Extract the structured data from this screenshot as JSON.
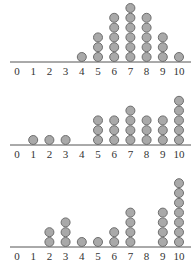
{
  "chart_data": [
    {
      "type": "dot",
      "title": "",
      "xlabel": "",
      "ylabel": "",
      "xlim": [
        0,
        10
      ],
      "tick_labels": [
        "0",
        "1",
        "2",
        "3",
        "4",
        "5",
        "6",
        "7",
        "8",
        "9",
        "10"
      ],
      "categories": [
        0,
        1,
        2,
        3,
        4,
        5,
        6,
        7,
        8,
        9,
        10
      ],
      "values": [
        0,
        0,
        0,
        0,
        1,
        3,
        5,
        6,
        5,
        3,
        1
      ]
    },
    {
      "type": "dot",
      "title": "",
      "xlabel": "",
      "ylabel": "",
      "xlim": [
        0,
        10
      ],
      "tick_labels": [
        "0",
        "1",
        "2",
        "3",
        "4",
        "5",
        "6",
        "7",
        "8",
        "9",
        "10"
      ],
      "categories": [
        0,
        1,
        2,
        3,
        4,
        5,
        6,
        7,
        8,
        9,
        10
      ],
      "values": [
        0,
        1,
        1,
        1,
        0,
        3,
        3,
        4,
        3,
        3,
        5
      ]
    },
    {
      "type": "dot",
      "title": "",
      "xlabel": "",
      "ylabel": "",
      "xlim": [
        0,
        10
      ],
      "tick_labels": [
        "0",
        "1",
        "2",
        "3",
        "4",
        "5",
        "6",
        "7",
        "8",
        "9",
        "10"
      ],
      "categories": [
        0,
        1,
        2,
        3,
        4,
        5,
        6,
        7,
        8,
        9,
        10
      ],
      "values": [
        0,
        0,
        2,
        3,
        1,
        1,
        2,
        4,
        0,
        4,
        7
      ]
    }
  ]
}
